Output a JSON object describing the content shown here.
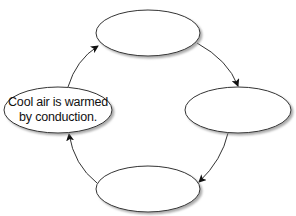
{
  "diagram": {
    "type": "cycle",
    "nodes": [
      {
        "id": "top",
        "text": ""
      },
      {
        "id": "right",
        "text": ""
      },
      {
        "id": "bottom",
        "text": ""
      },
      {
        "id": "left",
        "text": "Cool air is warmed by conduction."
      }
    ],
    "edges": [
      {
        "from": "left",
        "to": "top"
      },
      {
        "from": "top",
        "to": "right"
      },
      {
        "from": "right",
        "to": "bottom"
      },
      {
        "from": "bottom",
        "to": "left"
      }
    ],
    "colors": {
      "stroke": "#333333",
      "fill": "#ffffff",
      "shadow": "#9a9a9a"
    }
  }
}
